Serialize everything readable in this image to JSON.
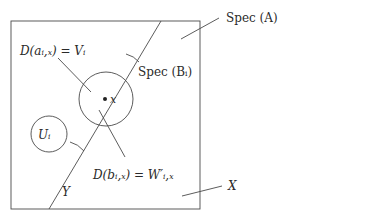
{
  "diagram": {
    "labels": {
      "spec_a": "Spec (A)",
      "spec_b": "Spec (Bᵢ)",
      "d_a": "D(aᵢ,ₓ) = Vᵢ",
      "d_b": "D(bᵢ,ₓ) = W′ᵢ,ₓ",
      "point_x": "x",
      "u_i": "Uᵢ",
      "y": "Y",
      "x_space": "X"
    },
    "colors": {
      "stroke": "#4a4a4a",
      "text": "#2a2a2a",
      "background": "#ffffff"
    }
  }
}
